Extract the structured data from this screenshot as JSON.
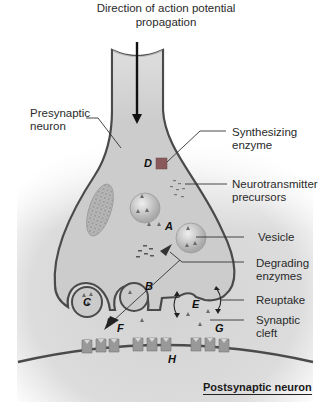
{
  "diagram": {
    "title": "Direction of action potential propagation",
    "title_lines": [
      "Direction of action potential",
      "propagation"
    ],
    "labels": {
      "presynaptic": [
        "Presynaptic",
        "neuron"
      ],
      "synthesizing_enzyme": [
        "Synthesizing",
        "enzyme"
      ],
      "nt_precursors": [
        "Neurotransmitter",
        "precursors"
      ],
      "vesicle": "Vesicle",
      "degrading_enzymes": [
        "Degrading",
        "enzymes"
      ],
      "reuptake": "Reuptake",
      "synaptic_cleft": [
        "Synaptic",
        "cleft"
      ],
      "postsynaptic": "Postsynaptic neuron"
    },
    "letters": {
      "A": "A",
      "B": "B",
      "C": "C",
      "D": "D",
      "E": "E",
      "F": "F",
      "G": "G",
      "H": "H"
    },
    "colors": {
      "membrane": "#4a4a4a",
      "cytoplasm": "#cfcfcf",
      "background_gray": "#d6d6d6",
      "enzyme": "#8a5a5a",
      "receptor": "#9a9a9a",
      "vesicle_fill": "#c8c8c8",
      "text": "#2a2a2a"
    }
  }
}
